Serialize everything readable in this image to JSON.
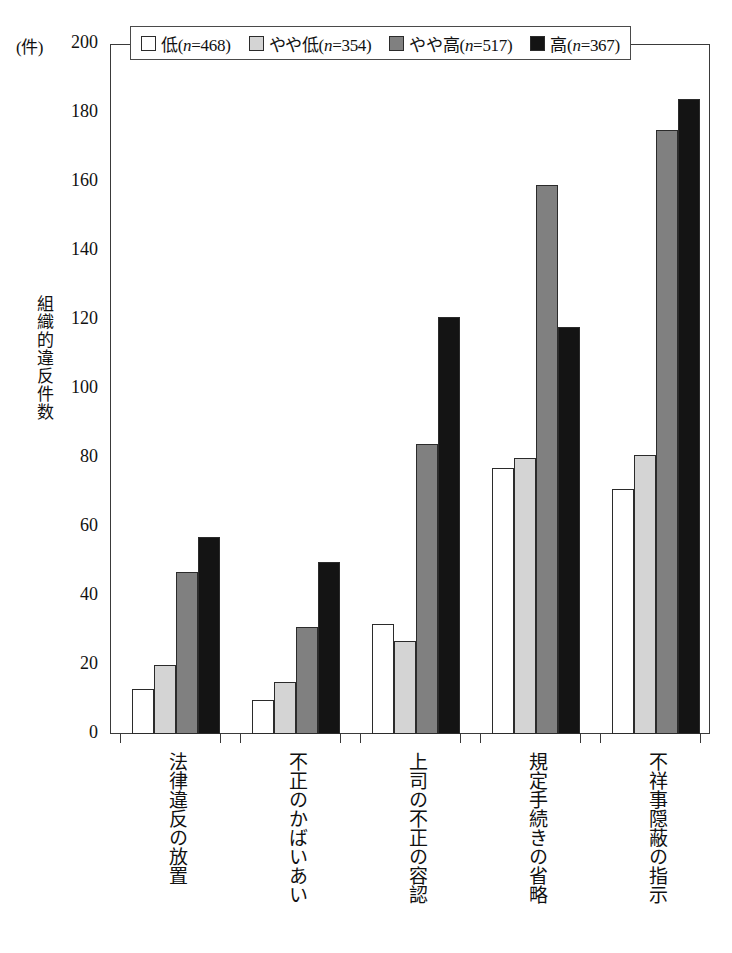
{
  "axis": {
    "unit_label": "(件)",
    "y_title": "組織的違反件数",
    "y_ticks": [
      "200",
      "180",
      "160",
      "140",
      "120",
      "100",
      "80",
      "60",
      "40",
      "20",
      "0"
    ]
  },
  "legend": {
    "items": [
      {
        "label": "低(n=468)",
        "label_prefix": "低(",
        "n_italic": "n",
        "n_value": "=468)",
        "color": "#ffffff",
        "key": "low"
      },
      {
        "label": "やや低(n=354)",
        "label_prefix": "やや低(",
        "n_italic": "n",
        "n_value": "=354)",
        "color": "#d4d4d4",
        "key": "somewhat-low"
      },
      {
        "label": "やや高(n=517)",
        "label_prefix": "やや高(",
        "n_italic": "n",
        "n_value": "=517)",
        "color": "#808080",
        "key": "somewhat-high"
      },
      {
        "label": "高(n=367)",
        "label_prefix": "高(",
        "n_italic": "n",
        "n_value": "=367)",
        "color": "#141414",
        "key": "high"
      }
    ]
  },
  "chart_data": {
    "type": "bar",
    "title": "",
    "xlabel": "",
    "ylabel": "組織的違反件数",
    "yunit": "(件)",
    "ylim": [
      0,
      200
    ],
    "ytick_step": 20,
    "grid": false,
    "legend_position": "top",
    "categories": [
      "法律違反の放置",
      "不正のかばいあい",
      "上司の不正の容認",
      "規定手続きの省略",
      "不祥事隠蔽の指示"
    ],
    "series": [
      {
        "name": "低(n=468)",
        "color": "#ffffff",
        "values": [
          13,
          10,
          32,
          77,
          71
        ]
      },
      {
        "name": "やや低(n=354)",
        "color": "#d4d4d4",
        "values": [
          20,
          15,
          27,
          80,
          81
        ]
      },
      {
        "name": "やや高(n=517)",
        "color": "#808080",
        "values": [
          47,
          31,
          84,
          159,
          175
        ]
      },
      {
        "name": "高(n=367)",
        "color": "#141414",
        "values": [
          57,
          50,
          121,
          118,
          184
        ]
      }
    ]
  }
}
